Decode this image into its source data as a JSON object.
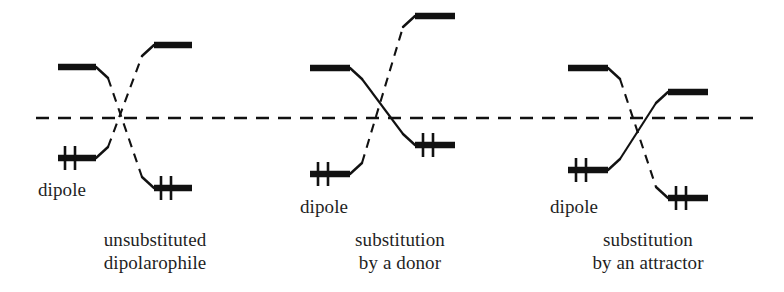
{
  "figure": {
    "reference_line_label": "energy reference level",
    "ink_color": "#111111",
    "background_color": "#ffffff"
  },
  "labels": {
    "dipole": "dipole",
    "panel1_line1": "unsubstituted",
    "panel1_line2": "dipolarophile",
    "panel2_line1": "substitution",
    "panel2_line2": "by a donor",
    "panel3_line1": "substitution",
    "panel3_line2": "by an attractor"
  },
  "chart_data": {
    "type": "diagram",
    "reference_line": {
      "y": 118,
      "x_start": 36,
      "x_end": 760,
      "style": "dashed"
    },
    "panels": [
      {
        "name": "unsubstituted-dipolarophile",
        "caption": [
          "unsubstituted",
          "dipolarophile"
        ],
        "caption_x": 155,
        "caption_y": 228,
        "dipole_label_x": 38,
        "dipole_label_y": 178,
        "levels": [
          {
            "role": "dipole-lumo",
            "x1": 58,
            "x2": 96,
            "y": 67,
            "electrons": 0
          },
          {
            "role": "dipole-homo",
            "x1": 58,
            "x2": 96,
            "y": 158,
            "electrons": 2
          },
          {
            "role": "dipolarophile-lumo",
            "x1": 154,
            "x2": 192,
            "y": 45,
            "electrons": 0
          },
          {
            "role": "dipolarophile-homo",
            "x1": 154,
            "x2": 192,
            "y": 188,
            "electrons": 2
          }
        ],
        "interactions": [
          {
            "from": "dipole-lumo",
            "to": "dipolarophile-homo",
            "style": "dashed"
          },
          {
            "from": "dipole-homo",
            "to": "dipolarophile-lumo",
            "style": "dashed"
          }
        ]
      },
      {
        "name": "substitution-by-a-donor",
        "caption": [
          "substitution",
          "by a donor"
        ],
        "caption_x": 400,
        "caption_y": 228,
        "dipole_label_x": 300,
        "dipole_label_y": 195,
        "levels": [
          {
            "role": "dipole-lumo",
            "x1": 310,
            "x2": 350,
            "y": 68,
            "electrons": 0
          },
          {
            "role": "dipole-homo",
            "x1": 310,
            "x2": 350,
            "y": 174,
            "electrons": 2
          },
          {
            "role": "dipolarophile-lumo",
            "x1": 415,
            "x2": 455,
            "y": 16,
            "electrons": 0
          },
          {
            "role": "dipolarophile-homo",
            "x1": 415,
            "x2": 455,
            "y": 145,
            "electrons": 2
          }
        ],
        "interactions": [
          {
            "from": "dipole-lumo",
            "to": "dipolarophile-homo",
            "style": "solid"
          },
          {
            "from": "dipole-homo",
            "to": "dipolarophile-lumo",
            "style": "dashed"
          }
        ]
      },
      {
        "name": "substitution-by-an-attractor",
        "caption": [
          "substitution",
          "by an attractor"
        ],
        "caption_x": 648,
        "caption_y": 228,
        "dipole_label_x": 550,
        "dipole_label_y": 195,
        "levels": [
          {
            "role": "dipole-lumo",
            "x1": 568,
            "x2": 608,
            "y": 68,
            "electrons": 0
          },
          {
            "role": "dipole-homo",
            "x1": 568,
            "x2": 608,
            "y": 170,
            "electrons": 2
          },
          {
            "role": "dipolarophile-lumo",
            "x1": 668,
            "x2": 708,
            "y": 92,
            "electrons": 0
          },
          {
            "role": "dipolarophile-homo",
            "x1": 668,
            "x2": 708,
            "y": 198,
            "electrons": 2
          }
        ],
        "interactions": [
          {
            "from": "dipole-lumo",
            "to": "dipolarophile-homo",
            "style": "dashed"
          },
          {
            "from": "dipole-homo",
            "to": "dipolarophile-lumo",
            "style": "solid"
          }
        ]
      }
    ]
  }
}
